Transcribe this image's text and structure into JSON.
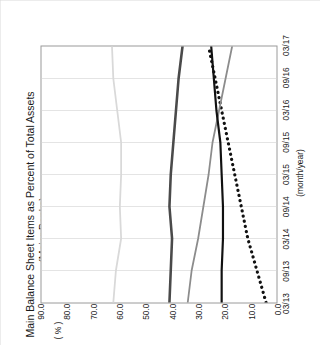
{
  "figure": {
    "title_line1": "Main Balance Sheet Items as Percent of Total Assets",
    "title_line2": "(Major Banks)",
    "unit_label": "( % )",
    "x_axis_unit": "(month/year)"
  },
  "legend": {
    "position": "top-left-inside-plot",
    "items": [
      {
        "label": "Due from banks",
        "color": "#111111",
        "style": "dotted"
      },
      {
        "label": "Securities",
        "color": "#8c8c8c",
        "style": "solid"
      },
      {
        "label": "Loans",
        "color": "#4a4a4a",
        "style": "solid"
      },
      {
        "label": "Deposits",
        "color": "#d9d9d9",
        "style": "solid"
      },
      {
        "label": "Deposit-loan gap",
        "color": "#111111",
        "style": "solid"
      }
    ]
  },
  "chart_data": {
    "type": "line",
    "title": "Main Balance Sheet Items as Percent of Total Assets (Major Banks)",
    "xlabel": "(month/year)",
    "ylabel": "( % )",
    "ylim": [
      0.0,
      90.0
    ],
    "ytick_labels": [
      "90.0",
      "80.0",
      "70.0",
      "60.0",
      "50.0",
      "40.0",
      "30.0",
      "20.0",
      "10.0",
      "0.0"
    ],
    "ytick_values": [
      90.0,
      80.0,
      70.0,
      60.0,
      50.0,
      40.0,
      30.0,
      20.0,
      10.0,
      0.0
    ],
    "grid": "vertical-only",
    "legend_position": "upper-left",
    "categories": [
      "03/13",
      "09/13",
      "03/14",
      "09/14",
      "03/15",
      "09/15",
      "03/16",
      "09/16",
      "03/17"
    ],
    "xtick_labels": [
      "03/13",
      "09/13",
      "03/14",
      "09/14",
      "03/15",
      "09/15",
      "03/16",
      "09/16",
      "03/17"
    ],
    "series": [
      {
        "name": "Due from banks",
        "values": [
          4.0,
          7.5,
          11.0,
          13.5,
          16.0,
          18.5,
          21.0,
          23.5,
          26.0
        ]
      },
      {
        "name": "Securities",
        "values": [
          34.0,
          32.5,
          30.0,
          28.0,
          26.0,
          24.5,
          22.0,
          19.5,
          17.0
        ]
      },
      {
        "name": "Loans",
        "values": [
          41.0,
          40.5,
          40.0,
          41.0,
          40.5,
          39.5,
          38.5,
          37.5,
          36.0
        ]
      },
      {
        "name": "Deposits",
        "values": [
          62.5,
          61.5,
          59.5,
          60.0,
          59.5,
          59.5,
          61.0,
          62.5,
          63.0
        ]
      },
      {
        "name": "Deposit-loan gap",
        "values": [
          21.0,
          21.0,
          20.5,
          20.5,
          21.0,
          21.5,
          23.0,
          24.0,
          25.0
        ]
      }
    ]
  }
}
